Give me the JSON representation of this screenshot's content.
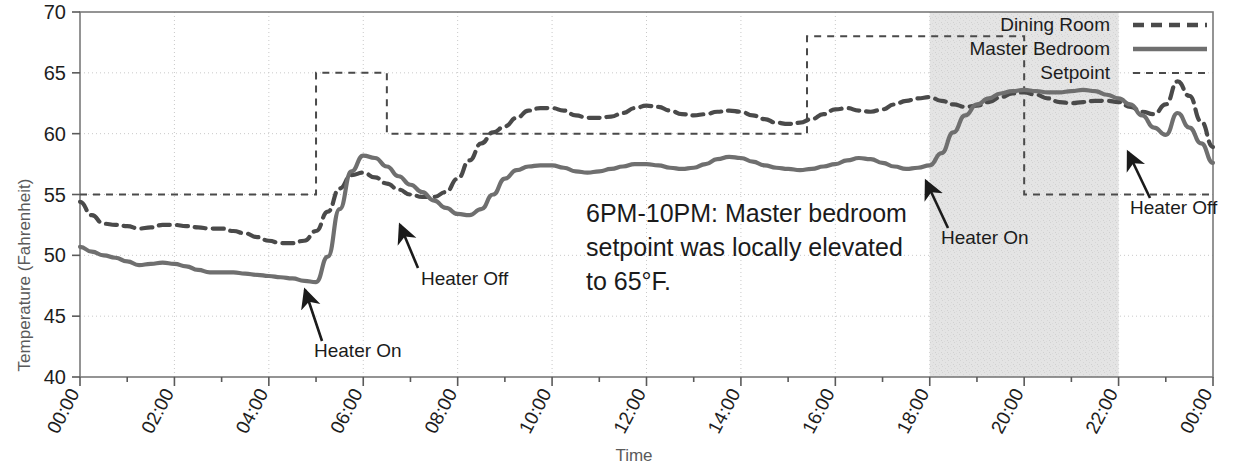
{
  "chart_data": {
    "type": "line",
    "title": "",
    "xlabel": "Time",
    "ylabel": "Temperature (Fahrenheit)",
    "ylim": [
      40,
      70
    ],
    "yticks": [
      40,
      45,
      50,
      55,
      60,
      65,
      70
    ],
    "xlim": [
      0,
      24
    ],
    "xticks": [
      0,
      2,
      4,
      6,
      8,
      10,
      12,
      14,
      16,
      18,
      20,
      22,
      24
    ],
    "xtick_labels": [
      "00:00",
      "02:00",
      "04:00",
      "06:00",
      "08:00",
      "10:00",
      "12:00",
      "14:00",
      "16:00",
      "18:00",
      "20:00",
      "22:00",
      "00:00"
    ],
    "grid": true,
    "legend_position": "top-right",
    "x_hours": [
      0,
      0.25,
      0.5,
      0.75,
      1,
      1.25,
      1.5,
      1.75,
      2,
      2.25,
      2.5,
      2.75,
      3,
      3.25,
      3.5,
      3.75,
      4,
      4.25,
      4.5,
      4.75,
      5,
      5.25,
      5.5,
      5.75,
      6,
      6.25,
      6.5,
      6.75,
      7,
      7.25,
      7.5,
      7.75,
      8,
      8.25,
      8.5,
      8.75,
      9,
      9.25,
      9.5,
      9.75,
      10,
      10.25,
      10.5,
      10.75,
      11,
      11.25,
      11.5,
      11.75,
      12,
      12.25,
      12.5,
      12.75,
      13,
      13.25,
      13.5,
      13.75,
      14,
      14.25,
      14.5,
      14.75,
      15,
      15.25,
      15.5,
      15.75,
      16,
      16.25,
      16.5,
      16.75,
      17,
      17.25,
      17.5,
      17.75,
      18,
      18.25,
      18.5,
      18.75,
      19,
      19.25,
      19.5,
      19.75,
      20,
      20.25,
      20.5,
      20.75,
      21,
      21.25,
      21.5,
      21.75,
      22,
      22.25,
      22.5,
      22.75,
      23,
      23.25,
      23.5,
      23.75,
      24
    ],
    "series": [
      {
        "name": "Dining Room",
        "style": "dashed-thick",
        "color": "#4a4a4a",
        "values": [
          54.4,
          53.3,
          52.6,
          52.5,
          52.4,
          52.2,
          52.3,
          52.5,
          52.5,
          52.4,
          52.3,
          52.2,
          52.2,
          52.0,
          51.8,
          51.5,
          51.2,
          51.0,
          51.0,
          51.2,
          52.0,
          53.6,
          55.5,
          56.6,
          56.8,
          56.4,
          55.9,
          55.4,
          55.0,
          54.8,
          54.8,
          55.2,
          56.3,
          57.8,
          59.2,
          60.1,
          60.6,
          61.3,
          61.9,
          62.1,
          62.1,
          61.9,
          61.5,
          61.3,
          61.3,
          61.4,
          61.7,
          62.1,
          62.3,
          62.2,
          61.9,
          61.6,
          61.5,
          61.6,
          61.8,
          61.9,
          61.8,
          61.5,
          61.2,
          60.9,
          60.8,
          60.9,
          61.2,
          61.6,
          62.0,
          62.1,
          61.9,
          61.8,
          62.0,
          62.4,
          62.7,
          62.9,
          63.0,
          62.7,
          62.4,
          62.2,
          62.3,
          62.6,
          63.0,
          63.3,
          63.4,
          63.2,
          62.9,
          62.6,
          62.5,
          62.6,
          62.7,
          62.7,
          62.6,
          62.2,
          61.8,
          61.6,
          62.4,
          64.3,
          63.1,
          61.0,
          58.9
        ]
      },
      {
        "name": "Master Bedroom",
        "style": "solid-thick",
        "color": "#6f6f6f",
        "values": [
          50.7,
          50.3,
          50.0,
          49.8,
          49.5,
          49.2,
          49.3,
          49.4,
          49.3,
          49.1,
          48.8,
          48.6,
          48.6,
          48.6,
          48.5,
          48.4,
          48.3,
          48.2,
          48.1,
          47.9,
          47.8,
          49.9,
          53.8,
          56.9,
          58.2,
          58.0,
          57.3,
          56.5,
          55.8,
          55.2,
          54.5,
          53.9,
          53.4,
          53.3,
          53.8,
          55.0,
          56.3,
          57.0,
          57.3,
          57.4,
          57.4,
          57.2,
          56.9,
          56.8,
          56.9,
          57.1,
          57.3,
          57.5,
          57.5,
          57.4,
          57.2,
          57.1,
          57.2,
          57.5,
          57.9,
          58.1,
          58.0,
          57.7,
          57.4,
          57.2,
          57.1,
          57.0,
          57.1,
          57.3,
          57.5,
          57.8,
          58.0,
          57.9,
          57.6,
          57.3,
          57.1,
          57.2,
          57.4,
          58.4,
          60.1,
          61.5,
          62.4,
          62.9,
          63.3,
          63.5,
          63.6,
          63.5,
          63.4,
          63.4,
          63.5,
          63.6,
          63.5,
          63.2,
          62.9,
          62.4,
          61.5,
          60.5,
          59.9,
          61.7,
          60.5,
          59.2,
          57.6
        ]
      }
    ],
    "setpoint": {
      "name": "Setpoint",
      "style": "dashed-thin",
      "color": "#4a4a4a",
      "steps": [
        {
          "from": 0,
          "to": 5,
          "value": 55
        },
        {
          "from": 5,
          "to": 6.5,
          "value": 65
        },
        {
          "from": 6.5,
          "to": 15.4,
          "value": 60
        },
        {
          "from": 15.4,
          "to": 20,
          "value": 68
        },
        {
          "from": 20,
          "to": 24,
          "value": 55
        }
      ]
    },
    "shaded_region": {
      "from": 18,
      "to": 22,
      "color": "#e2e2e2"
    },
    "annotations": [
      {
        "id": "heater-on-1",
        "text": "Heater On",
        "x": 5.0,
        "y": 47.8
      },
      {
        "id": "heater-off-1",
        "text": "Heater Off",
        "x": 7.0,
        "y": 53.4
      },
      {
        "id": "heater-on-2",
        "text": "Heater On",
        "x": 17.9,
        "y": 57.4
      },
      {
        "id": "heater-off-2",
        "text": "Heater Off",
        "x": 22.1,
        "y": 59.9
      },
      {
        "id": "setpoint-note",
        "text": "6PM-10PM: Master bedroom setpoint was locally elevated to 65°F."
      }
    ],
    "annotation_lines": [
      "6PM-10PM: Master bedroom",
      "setpoint was locally elevated",
      "to 65°F."
    ]
  }
}
